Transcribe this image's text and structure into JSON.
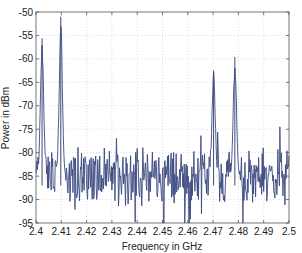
{
  "chart_data": {
    "type": "line",
    "title": "",
    "xlabel": "Frequency in GHz",
    "ylabel": "Power in dBm",
    "xlim": [
      2.4,
      2.5
    ],
    "ylim": [
      -95,
      -50
    ],
    "xticks": [
      2.4,
      2.41,
      2.42,
      2.43,
      2.44,
      2.45,
      2.46,
      2.47,
      2.48,
      2.49,
      2.5
    ],
    "xtick_labels": [
      "2.4",
      "2.41",
      "2.42",
      "2.43",
      "2.44",
      "2.45",
      "2.46",
      "2.47",
      "2.48",
      "2.49",
      "2.5"
    ],
    "yticks": [
      -50,
      -55,
      -60,
      -65,
      -70,
      -75,
      -80,
      -85,
      -90,
      -95
    ],
    "ytick_labels": [
      "-50",
      "-55",
      "-60",
      "-65",
      "-70",
      "-75",
      "-80",
      "-85",
      "-90",
      "-95"
    ],
    "grid": true,
    "grid_style": "dotted",
    "legend": null,
    "line_color": "#3c4a80",
    "noise_floor_dbm": -85,
    "noise_range_dbm": [
      -95,
      -77
    ],
    "peaks": [
      {
        "freq_ghz": 2.4024,
        "power_dbm": -55.6,
        "note": "narrow spike with secondary at ~-66 dBm"
      },
      {
        "freq_ghz": 2.4098,
        "power_dbm": -51.0,
        "note": "highest peak, side spike ~-60 dBm"
      },
      {
        "freq_ghz": 2.4702,
        "power_dbm": -62.5,
        "note": "broad peak, shoulder ~-67 dBm"
      },
      {
        "freq_ghz": 2.4786,
        "power_dbm": -59.6,
        "note": "peak with shoulder ~-68 dBm"
      }
    ],
    "deep_dips": [
      {
        "freq_ghz": 2.4505,
        "power_dbm": -95
      },
      {
        "freq_ghz": 2.4605,
        "power_dbm": -95
      }
    ]
  }
}
